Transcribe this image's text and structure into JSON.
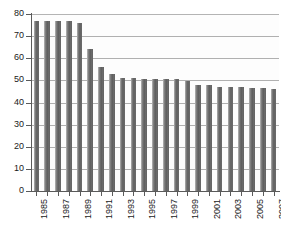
{
  "chart_data": {
    "type": "bar",
    "title": "",
    "subtitle": "",
    "xlabel": "",
    "ylabel": "",
    "ylim": [
      0,
      80
    ],
    "ytick_values": [
      0,
      10,
      20,
      30,
      40,
      50,
      60,
      70,
      80
    ],
    "ytick_labels": [
      "0",
      "10",
      "20",
      "30",
      "40",
      "50",
      "60",
      "70",
      "80"
    ],
    "grid": true,
    "grid_axis": "y",
    "legend": false,
    "legend_position": "none",
    "bar_color": "#6e6e6e",
    "gridline_color": "#b0b0b0",
    "axis_color": "#5a5a5a",
    "categories": [
      "1985",
      "1986",
      "1987",
      "1988",
      "1989",
      "1990",
      "1991",
      "1992",
      "1993",
      "1994",
      "1995",
      "1996",
      "1997",
      "1998",
      "1999",
      "2000",
      "2001",
      "2002",
      "2003",
      "2004",
      "2005",
      "2006",
      "2007"
    ],
    "xtick_labels_shown": [
      "1985",
      "",
      "1987",
      "",
      "1989",
      "",
      "1991",
      "",
      "1993",
      "",
      "1995",
      "",
      "1997",
      "",
      "1999",
      "",
      "2001",
      "",
      "2003",
      "",
      "2005",
      "",
      "2007"
    ],
    "values": [
      77,
      77,
      77,
      77,
      76,
      64,
      56,
      53,
      51,
      51,
      50.5,
      50.5,
      50.5,
      50.5,
      49.5,
      48,
      48,
      47,
      47,
      47,
      46.5,
      46.5,
      46
    ]
  }
}
